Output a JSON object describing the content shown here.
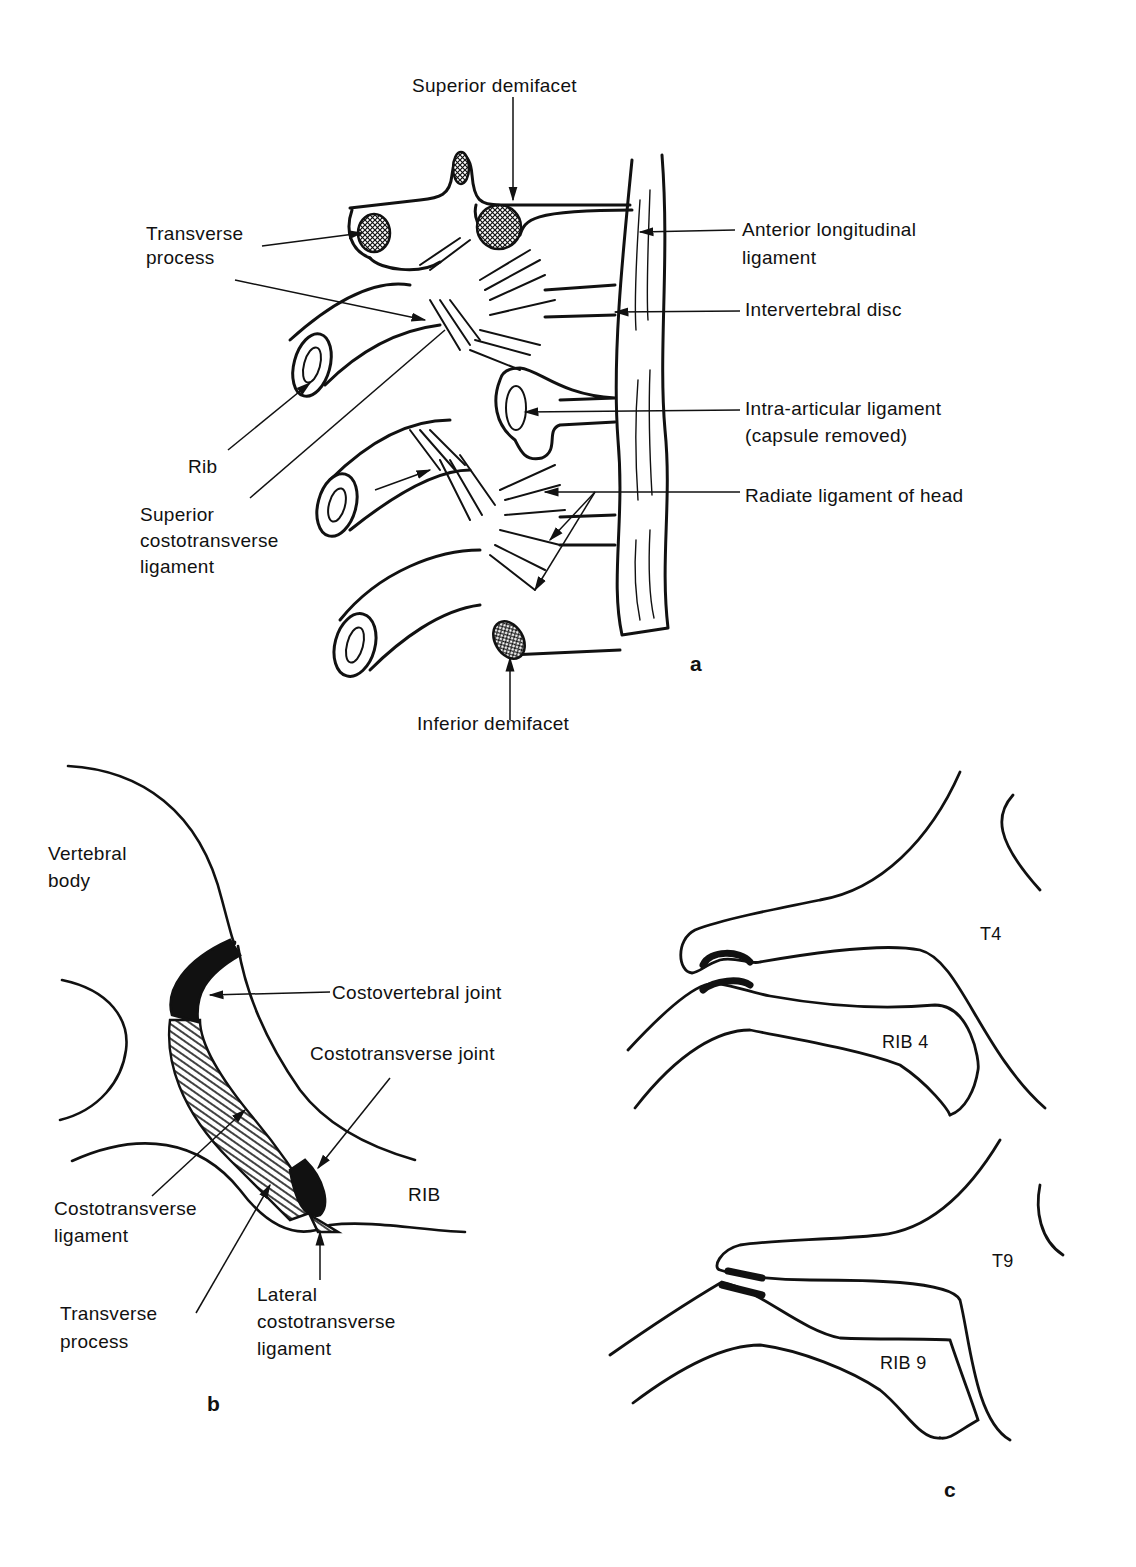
{
  "panel_a": {
    "letter": "a",
    "labels": {
      "superior_demifacet": "Superior demifacet",
      "transverse_process_1": "Transverse",
      "transverse_process_2": "process",
      "anterior_longitudinal_1": "Anterior longitudinal",
      "anterior_longitudinal_2": "ligament",
      "intervertebral_disc": "Intervertebral disc",
      "intra_articular_1": "Intra-articular ligament",
      "intra_articular_2": "(capsule removed)",
      "radiate_ligament": "Radiate ligament of head",
      "rib": "Rib",
      "superior_costotransverse_1": "Superior",
      "superior_costotransverse_2": "costotransverse",
      "superior_costotransverse_3": "ligament",
      "inferior_demifacet": "Inferior demifacet"
    }
  },
  "panel_b": {
    "letter": "b",
    "labels": {
      "vertebral_body_1": "Vertebral",
      "vertebral_body_2": "body",
      "costovertebral_joint": "Costovertebral joint",
      "costotransverse_joint": "Costotransverse joint",
      "rib": "RIB",
      "costotransverse_ligament_1": "Costotransverse",
      "costotransverse_ligament_2": "ligament",
      "transverse_process_1": "Transverse",
      "transverse_process_2": "process",
      "lateral_costotransverse_1": "Lateral",
      "lateral_costotransverse_2": "costotransverse",
      "lateral_costotransverse_3": "ligament"
    }
  },
  "panel_c": {
    "letter": "c",
    "labels": {
      "t4": "T4",
      "rib4": "RIB 4",
      "t9": "T9",
      "rib9": "RIB 9"
    }
  }
}
